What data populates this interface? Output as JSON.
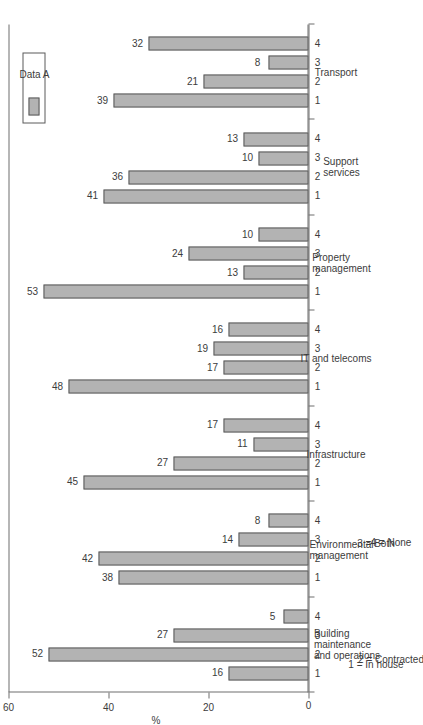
{
  "figure": {
    "legend_label": "Data A",
    "value_axis_title": "%",
    "tick_labels": [
      "0",
      "20",
      "40",
      "60"
    ],
    "key": {
      "line1": "1 = In house",
      "line2": "2 = Contracted",
      "line3": "3 = Both",
      "line4": "4 = None"
    }
  },
  "chart_data": {
    "type": "bar",
    "title": "",
    "subtitle": "",
    "orientation": "vertical-rotated",
    "xlabel": "",
    "ylabel": "%",
    "ylim": [
      0,
      60
    ],
    "yticks": [
      0,
      20,
      40,
      60
    ],
    "grid": false,
    "legend_position": "top-right",
    "series": [
      {
        "name": "Data A",
        "color": "#b3b3b3"
      }
    ],
    "subcategory_codes": [
      "1",
      "2",
      "3",
      "4"
    ],
    "subcategory_key": {
      "1": "In house",
      "2": "Contracted",
      "3": "Both",
      "4": "None"
    },
    "groups": [
      {
        "label": "Building maintenance and operations",
        "label_lines": [
          "Building",
          "maintenance",
          "and operations"
        ],
        "values": [
          16,
          52,
          27,
          5
        ]
      },
      {
        "label": "Environmental management",
        "label_lines": [
          "Environmental",
          "management"
        ],
        "values": [
          38,
          42,
          14,
          8
        ]
      },
      {
        "label": "Infrastructure",
        "label_lines": [
          "Infrastructure"
        ],
        "values": [
          45,
          27,
          11,
          17
        ]
      },
      {
        "label": "IT and telecoms",
        "label_lines": [
          "IT and telecoms"
        ],
        "values": [
          48,
          17,
          19,
          16
        ]
      },
      {
        "label": "Property management",
        "label_lines": [
          "Property",
          "management"
        ],
        "values": [
          53,
          13,
          24,
          10
        ]
      },
      {
        "label": "Support services",
        "label_lines": [
          "Support",
          "services"
        ],
        "values": [
          41,
          36,
          10,
          13
        ]
      },
      {
        "label": "Transport",
        "label_lines": [
          "Transport"
        ],
        "values": [
          39,
          21,
          8,
          32
        ]
      }
    ],
    "annotations": [
      "1 = In house",
      "2 = Contracted",
      "3 = Both",
      "4 = None"
    ]
  }
}
